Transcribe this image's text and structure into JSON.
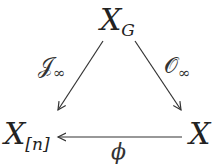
{
  "diagram": {
    "type": "commutative-triangle",
    "nodes": {
      "top": {
        "main": "X",
        "sub": "G"
      },
      "left": {
        "main": "X",
        "sub": "[n]"
      },
      "right": {
        "main": "X",
        "sub": ""
      }
    },
    "arrows": {
      "top_to_left": {
        "symbol": "𝒥",
        "sub": "∞"
      },
      "top_to_right": {
        "symbol": "𝒪",
        "sub": "∞"
      },
      "right_to_left": {
        "symbol": "ϕ",
        "sub": ""
      }
    },
    "colors": {
      "stroke": "#333333",
      "background": "#ffffff"
    }
  }
}
